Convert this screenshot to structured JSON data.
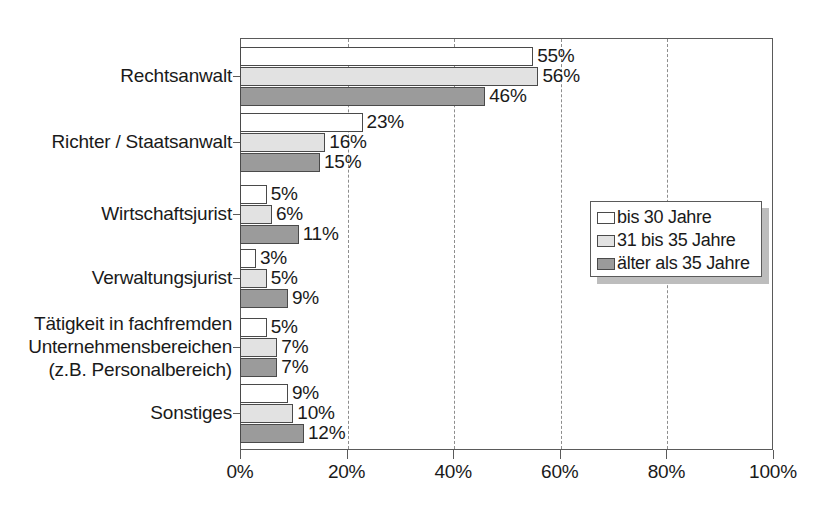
{
  "chart_data": {
    "type": "bar",
    "orientation": "horizontal",
    "title": "",
    "xlabel": "",
    "ylabel": "",
    "xlim": [
      0,
      100
    ],
    "xticks": [
      "0%",
      "20%",
      "40%",
      "60%",
      "80%",
      "100%"
    ],
    "xtick_values": [
      0,
      20,
      40,
      60,
      80,
      100
    ],
    "grid": true,
    "legend_position": "right-middle",
    "categories": [
      "Rechtsanwalt",
      "Richter / Staatsanwalt",
      "Wirtschaftsjurist",
      "Verwaltungsjurist",
      "Tätigkeit in fachfremden\nUnternehmensbereichen\n(z.B. Personalbereich)",
      "Sonstiges"
    ],
    "series": [
      {
        "name": "bis 30 Jahre",
        "color": "#ffffff",
        "values": [
          55,
          23,
          5,
          3,
          5,
          9
        ],
        "labels": [
          "55%",
          "23%",
          "5%",
          "3%",
          "5%",
          "9%"
        ]
      },
      {
        "name": "31 bis 35 Jahre",
        "color": "#e2e2e2",
        "values": [
          56,
          16,
          6,
          5,
          7,
          10
        ],
        "labels": [
          "56%",
          "16%",
          "6%",
          "5%",
          "7%",
          "10%"
        ]
      },
      {
        "name": "älter als 35 Jahre",
        "color": "#9b9b9b",
        "values": [
          46,
          15,
          11,
          9,
          7,
          12
        ],
        "labels": [
          "46%",
          "15%",
          "11%",
          "9%",
          "7%",
          "12%"
        ]
      }
    ]
  },
  "legend": {
    "items": [
      {
        "label": "bis 30 Jahre",
        "swatch": "white-swatch"
      },
      {
        "label": "31 bis 35 Jahre",
        "swatch": "light-gray-swatch"
      },
      {
        "label": "älter als 35 Jahre",
        "swatch": "dark-gray-swatch"
      }
    ]
  },
  "axis": {
    "x_tick_labels": [
      "0%",
      "20%",
      "40%",
      "60%",
      "80%",
      "100%"
    ]
  },
  "category_labels": [
    "Rechtsanwalt",
    "Richter / Staatsanwalt",
    "Wirtschaftsjurist",
    "Verwaltungsjurist",
    "Tätigkeit in fachfremden\nUnternehmensbereichen\n(z.B. Personalbereich)",
    "Sonstiges"
  ]
}
